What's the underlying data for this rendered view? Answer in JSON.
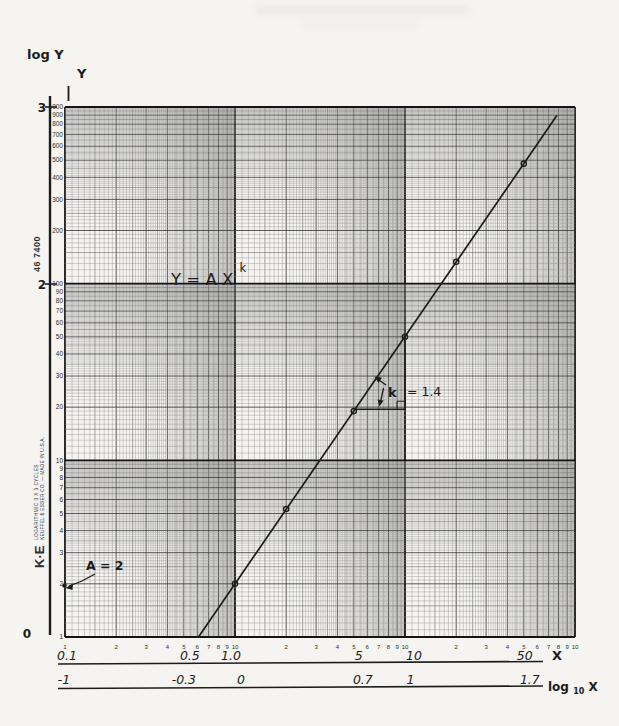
{
  "paper": {
    "catalog_number": "46 7400",
    "brand": "K·E",
    "product_line1": "LOGARITHMIC 3 X 3 CYCLES",
    "product_line2": "KEUFFEL & ESSER CO. — MADE IN U.S.A."
  },
  "axes": {
    "hand_log_y_title": "log Y",
    "hand_y_title": "Y",
    "hand_log_y_ticks": [
      "3",
      "2",
      "0"
    ],
    "hand_x_title": "X",
    "hand_log_x_title_base": "log",
    "hand_log_x_title_sub": "10",
    "hand_log_x_title_var": " X",
    "printed_y_labels": [
      "1000",
      "900",
      "800",
      "700",
      "600",
      "500",
      "400",
      "300",
      "200",
      "100",
      "90",
      "80",
      "70",
      "60",
      "50",
      "40",
      "30",
      "20",
      "10",
      "9",
      "8",
      "7",
      "6",
      "5",
      "4",
      "3",
      "2",
      "1"
    ],
    "printed_x_decade1": [
      "1",
      "2",
      "3",
      "4",
      "5",
      "6",
      "7",
      "8",
      "9",
      "10"
    ],
    "printed_x_decade2": [
      "2",
      "3",
      "4",
      "5",
      "6",
      "7",
      "8",
      "9",
      "10"
    ],
    "printed_x_decade3": [
      "2",
      "3",
      "4",
      "5",
      "6",
      "7",
      "8",
      "9",
      "10"
    ],
    "hand_x_scale": [
      {
        "label": "0.1",
        "X": 0.1
      },
      {
        "label": "0.5",
        "X": 0.5
      },
      {
        "label": "1.0",
        "X": 1
      },
      {
        "label": "5",
        "X": 5
      },
      {
        "label": "10",
        "X": 10
      },
      {
        "label": "50",
        "X": 50
      }
    ],
    "hand_log_x_scale": [
      {
        "label": "-1",
        "X": 0.1
      },
      {
        "label": "-0.3",
        "X": 0.5
      },
      {
        "label": "0",
        "X": 1
      },
      {
        "label": "0.7",
        "X": 5
      },
      {
        "label": "1",
        "X": 10
      },
      {
        "label": "1.7",
        "X": 50
      }
    ]
  },
  "annotations": {
    "equation_base": "Y = A X",
    "equation_exponent": "k",
    "slope_k_symbol": "k",
    "slope_value": "= 1.4",
    "intercept": "A = 2"
  },
  "chart_data": {
    "type": "scatter",
    "scale": "log-log",
    "xlabel": "X",
    "ylabel": "Y",
    "x_range": [
      0.1,
      100
    ],
    "y_range": [
      1,
      1000
    ],
    "points": [
      [
        1,
        2
      ],
      [
        2,
        5.3
      ],
      [
        5,
        19
      ],
      [
        10,
        50
      ],
      [
        20,
        133
      ],
      [
        50,
        478
      ]
    ],
    "fit_line": {
      "model": "power",
      "formula": "Y = A·X^k",
      "A": 2,
      "k": 1.4,
      "x_start": 0.61,
      "x_end": 78
    },
    "slope_triangle": {
      "x1": 5.08,
      "x2": 10,
      "k_label": "k = 1.4"
    },
    "intercept_point": {
      "X": 0.1,
      "Y": 2,
      "label": "A = 2"
    },
    "hand_x_ticks": [
      0.1,
      0.5,
      1,
      5,
      10,
      50
    ],
    "hand_log10x_ticks": [
      -1,
      -0.3,
      0,
      0.7,
      1,
      1.7
    ],
    "hand_log_y_ticks": [
      3,
      2,
      0
    ]
  },
  "colors": {
    "ink": "#1c1c1c",
    "grid_minor": "#979797",
    "grid_mid": "#6a6a6a",
    "grid_major": "#3b3b3b",
    "grid_decade": "#141414",
    "paper": "#f5f4f0",
    "print_ink": "#2e2e2e"
  }
}
